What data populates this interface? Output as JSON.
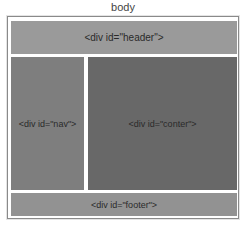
{
  "diagram": {
    "title": "body",
    "boxes": {
      "header": {
        "label": "<div id=\"header\">",
        "color": "#9a9a9a"
      },
      "nav": {
        "label": "<div id=\"nav\">",
        "color": "#7e7e7e"
      },
      "content": {
        "label": "<div id=\"conter\">",
        "color": "#686868"
      },
      "footer": {
        "label": "<div id=\"footer\">",
        "color": "#929292"
      }
    }
  }
}
